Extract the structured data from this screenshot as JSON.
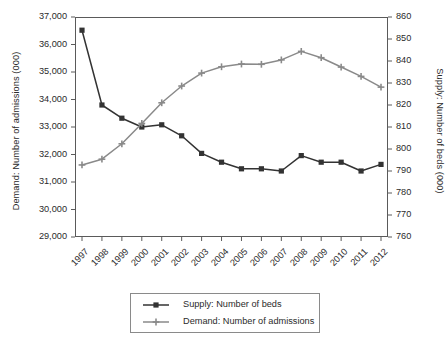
{
  "chart_data": {
    "type": "line",
    "title": "",
    "xlabel": "",
    "categories": [
      "1997",
      "1998",
      "1999",
      "2000",
      "2001",
      "2002",
      "2003",
      "2004",
      "2005",
      "2006",
      "2007",
      "2008",
      "2009",
      "2010",
      "2011",
      "2012"
    ],
    "grid": false,
    "legend_position": "bottom",
    "axes": {
      "left": {
        "label": "Demand: Number of admissions (000)",
        "ticks": [
          "29,000",
          "30,000",
          "31,000",
          "32,000",
          "33,000",
          "34,000",
          "35,000",
          "36,000",
          "37,000"
        ],
        "tick_values": [
          29000,
          30000,
          31000,
          32000,
          33000,
          34000,
          35000,
          36000,
          37000
        ],
        "ylim": [
          29000,
          37000
        ]
      },
      "right": {
        "label": "Supply: Number of beds (000)",
        "ticks": [
          "760",
          "770",
          "780",
          "790",
          "800",
          "810",
          "820",
          "830",
          "840",
          "850",
          "860"
        ],
        "tick_values": [
          760,
          770,
          780,
          790,
          800,
          810,
          820,
          830,
          840,
          850,
          860
        ],
        "ylim": [
          760,
          860
        ]
      }
    },
    "series": [
      {
        "name": "Supply: Number of beds",
        "axis": "right",
        "color": "#333333",
        "marker": "square",
        "values": [
          854,
          820,
          814,
          810,
          811,
          806,
          798,
          794,
          791,
          791,
          790,
          797,
          794,
          794,
          790,
          793
        ]
      },
      {
        "name": "Demand: Number of admissions",
        "axis": "left",
        "color": "#8a8a8a",
        "marker": "plus",
        "values": [
          31620,
          31830,
          32390,
          33130,
          33880,
          34490,
          34960,
          35190,
          35290,
          35280,
          35440,
          35750,
          35520,
          35180,
          34840,
          34450
        ]
      }
    ]
  },
  "legend": {
    "items": [
      {
        "label": "Supply: Number of beds",
        "color": "#333333",
        "marker": "square"
      },
      {
        "label": "Demand: Number of admissions",
        "color": "#8a8a8a",
        "marker": "plus"
      }
    ]
  }
}
